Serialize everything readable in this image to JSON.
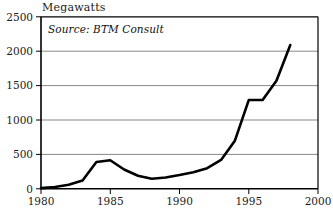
{
  "chart_data": {
    "type": "line",
    "title": "Megawatts",
    "xlabel": "",
    "ylabel": "Megawatts",
    "annotation": "Source: BTM Consult",
    "grid": true,
    "legend": "none",
    "xlim": [
      1980,
      2000
    ],
    "ylim": [
      0,
      2500
    ],
    "xticks": [
      "1980",
      "1985",
      "1990",
      "1995",
      "2000"
    ],
    "yticks": [
      "0",
      "500",
      "1000",
      "1500",
      "2000",
      "2500"
    ],
    "x": [
      1980,
      1981,
      1982,
      1983,
      1984,
      1985,
      1986,
      1987,
      1988,
      1989,
      1990,
      1991,
      1992,
      1993,
      1994,
      1995,
      1996,
      1997,
      1998
    ],
    "values": [
      10,
      25,
      60,
      120,
      390,
      415,
      280,
      190,
      145,
      165,
      200,
      240,
      300,
      420,
      700,
      1290,
      1290,
      1570,
      2090
    ],
    "series": [
      {
        "name": "Annual wind capacity installed",
        "color": "#000000",
        "values": [
          10,
          25,
          60,
          120,
          390,
          415,
          280,
          190,
          145,
          165,
          200,
          240,
          300,
          420,
          700,
          1290,
          1290,
          1570,
          2090
        ]
      }
    ]
  },
  "axis": {
    "y_labels": [
      "2500",
      "2000",
      "1500",
      "1000",
      "500",
      "0"
    ],
    "x_labels": [
      "1980",
      "1985",
      "1990",
      "1995",
      "2000"
    ]
  },
  "colors": {
    "line": "#000000",
    "grid": "#888888",
    "frame": "#000000",
    "background": "#ffffff",
    "text": "#1a1a1a"
  }
}
